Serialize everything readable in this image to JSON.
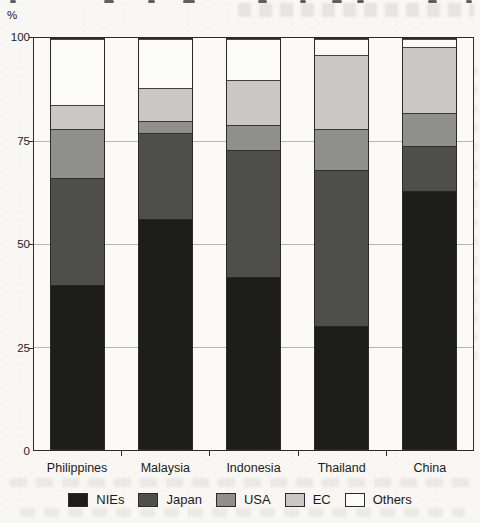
{
  "y_axis": {
    "unit": "%",
    "ticks": [
      0,
      25,
      50,
      75,
      100
    ]
  },
  "chart_data": {
    "type": "bar",
    "stacked": true,
    "title": "",
    "categories": [
      "Philippines",
      "Malaysia",
      "Indonesia",
      "Thailand",
      "China"
    ],
    "series": [
      {
        "name": "NIEs",
        "color": "#1d1d1c",
        "values": [
          40,
          56,
          42,
          30,
          63
        ]
      },
      {
        "name": "Japan",
        "color": "#4e4e4d",
        "values": [
          26,
          21,
          31,
          38,
          11
        ]
      },
      {
        "name": "USA",
        "color": "#8f8f8d",
        "values": [
          12,
          3,
          6,
          10,
          8
        ]
      },
      {
        "name": "EC",
        "color": "#c9c8c4",
        "values": [
          6,
          8,
          11,
          18,
          16
        ]
      },
      {
        "name": "Others",
        "color": "#fbfbf8",
        "values": [
          16,
          12,
          10,
          4,
          2
        ]
      }
    ],
    "ylabel": "%",
    "ylim": [
      0,
      100
    ],
    "yticks": [
      0,
      25,
      50,
      75,
      100
    ],
    "grid": true,
    "legend_position": "bottom",
    "legend": [
      "NIEs",
      "Japan",
      "USA",
      "EC",
      "Others"
    ]
  }
}
